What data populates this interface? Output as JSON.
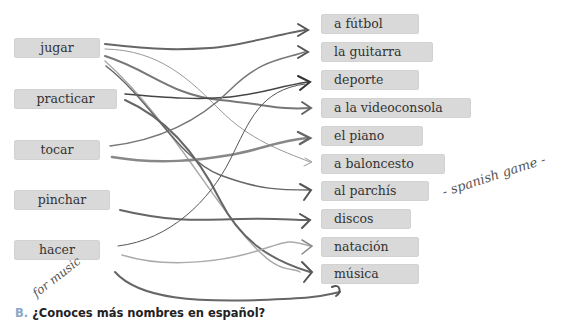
{
  "left_items": [
    {
      "label": "jugar"
    },
    {
      "label": "practicar"
    },
    {
      "label": "tocar"
    },
    {
      "label": "pinchar"
    },
    {
      "label": "hacer"
    }
  ],
  "right_items": [
    {
      "label": "a fútbol"
    },
    {
      "label": "la guitarra"
    },
    {
      "label": "deporte"
    },
    {
      "label": "a la videoconsola"
    },
    {
      "label": "el piano"
    },
    {
      "label": "a baloncesto"
    },
    {
      "label": "al parchís"
    },
    {
      "label": "discos"
    },
    {
      "label": "natación"
    },
    {
      "label": "música"
    }
  ],
  "handwritten": {
    "spanish_game": "- spanish game -",
    "for_music": "for music"
  },
  "question": {
    "letter": "B.",
    "text": "¿Conoces más nombres en español?"
  },
  "colors": {
    "box": "#d9d9d9",
    "pencil": "#555555",
    "question_letter": "#8aa7c6"
  }
}
